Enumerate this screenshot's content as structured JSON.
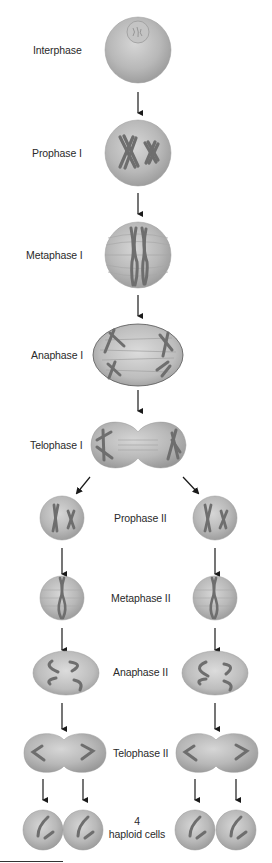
{
  "diagram": {
    "type": "meiosis-flowchart",
    "stages": [
      {
        "id": "interphase",
        "label": "Interphase"
      },
      {
        "id": "prophase-1",
        "label": "Prophase I"
      },
      {
        "id": "metaphase-1",
        "label": "Metaphase I"
      },
      {
        "id": "anaphase-1",
        "label": "Anaphase I"
      },
      {
        "id": "telophase-1",
        "label": "Telophase I"
      },
      {
        "id": "prophase-2",
        "label": "Prophase II"
      },
      {
        "id": "metaphase-2",
        "label": "Metaphase II"
      },
      {
        "id": "anaphase-2",
        "label": "Anaphase II"
      },
      {
        "id": "telophase-2",
        "label": "Telophase II"
      },
      {
        "id": "haploid",
        "label_line1": "4",
        "label_line2": "haploid cells"
      }
    ],
    "colors": {
      "cell_fill": "#b5b5b5",
      "cell_highlight": "#d8d8d8",
      "cell_edge": "#8c8c8c",
      "chromosome": "#6e6e6e",
      "arrow": "#1a1a1a",
      "text": "#2a2a2a"
    }
  }
}
